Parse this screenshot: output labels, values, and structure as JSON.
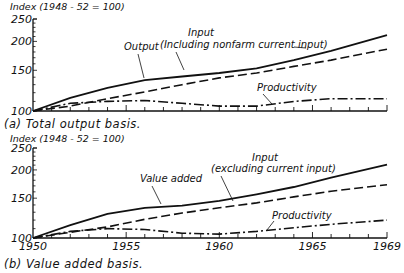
{
  "chart_data": [
    {
      "type": "line",
      "panel": "a",
      "title": "(a)  Total output basis.",
      "ylabel": "Index (1948 - 52 = 100)",
      "xlabel": "",
      "yscale": "log",
      "ylim": [
        100,
        250
      ],
      "xlim": [
        1950,
        1969
      ],
      "yticks": [
        "100",
        "150",
        "200",
        "250"
      ],
      "xticks": [],
      "grid": false,
      "series": [
        {
          "name": "Output",
          "style": "solid",
          "x": [
            1950,
            1952,
            1954,
            1956,
            1958,
            1960,
            1962,
            1964,
            1966,
            1969
          ],
          "values": [
            100,
            114,
            126,
            136,
            141,
            146,
            153,
            166,
            182,
            213
          ]
        },
        {
          "name": "Input (Including nonfarm current input)",
          "style": "dashed",
          "x": [
            1950,
            1952,
            1954,
            1956,
            1958,
            1960,
            1962,
            1964,
            1966,
            1969
          ],
          "values": [
            100,
            105,
            113,
            121,
            130,
            139,
            146,
            156,
            166,
            185
          ]
        },
        {
          "name": "Productivity",
          "style": "dashdot",
          "x": [
            1950,
            1952,
            1954,
            1956,
            1958,
            1960,
            1962,
            1964,
            1966,
            1969
          ],
          "values": [
            100,
            108,
            110,
            111,
            108,
            105,
            105,
            110,
            113,
            113
          ]
        }
      ],
      "annotations": [
        {
          "text": "Output",
          "target": "Output"
        },
        {
          "text": "Input",
          "target": "Input (Including nonfarm current input)"
        },
        {
          "text": "(Including nonfarm current input)",
          "target": "Input (Including nonfarm current input)"
        },
        {
          "text": "Productivity",
          "target": "Productivity"
        }
      ]
    },
    {
      "type": "line",
      "panel": "b",
      "title": "(b)  Value added basis.",
      "ylabel": "Index (1948 - 52 = 100)",
      "xlabel": "",
      "yscale": "log",
      "ylim": [
        100,
        250
      ],
      "xlim": [
        1950,
        1969
      ],
      "yticks": [
        "100",
        "150",
        "200",
        "250"
      ],
      "xticks": [
        "1950",
        "1955",
        "1960",
        "1965",
        "1969"
      ],
      "grid": false,
      "series": [
        {
          "name": "Value added",
          "style": "solid",
          "x": [
            1950,
            1952,
            1954,
            1956,
            1958,
            1960,
            1962,
            1964,
            1966,
            1969
          ],
          "values": [
            100,
            114,
            128,
            136,
            139,
            146,
            156,
            168,
            185,
            211
          ]
        },
        {
          "name": "Input (excluding current input)",
          "style": "dashed",
          "x": [
            1950,
            1952,
            1954,
            1956,
            1958,
            1960,
            1962,
            1964,
            1966,
            1969
          ],
          "values": [
            100,
            106,
            112,
            121,
            129,
            136,
            143,
            152,
            161,
            172
          ]
        },
        {
          "name": "Productivity",
          "style": "dashdot",
          "x": [
            1950,
            1952,
            1954,
            1956,
            1958,
            1960,
            1962,
            1964,
            1966,
            1969
          ],
          "values": [
            100,
            107,
            110,
            109,
            105,
            104,
            107,
            111,
            115,
            120
          ]
        }
      ],
      "annotations": [
        {
          "text": "Value added",
          "target": "Value added"
        },
        {
          "text": "Input",
          "target": "Input (excluding current input)"
        },
        {
          "text": "(excluding current input)",
          "target": "Input (excluding current input)"
        },
        {
          "text": "Productivity",
          "target": "Productivity"
        }
      ]
    }
  ]
}
